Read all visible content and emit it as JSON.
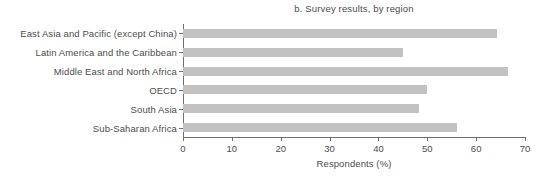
{
  "chart_data": {
    "type": "bar",
    "orientation": "horizontal",
    "title": "b. Survey results, by region",
    "xlabel": "Respondents (%)",
    "ylabel": "",
    "xlim": [
      0,
      70
    ],
    "xticks": [
      0,
      10,
      20,
      30,
      40,
      50,
      60,
      70
    ],
    "xtick_labels": [
      "0",
      "10",
      "20",
      "30",
      "40",
      "50",
      "60",
      "70"
    ],
    "grid": false,
    "legend": false,
    "bar_color": "#c2c2c2",
    "axis_color": "#6f6f6f",
    "text_color": "#4d4d4d",
    "categories": [
      "East Asia and Pacific (except China)",
      "Latin America and the Caribbean",
      "Middle East and North Africa",
      "OECD",
      "South Asia",
      "Sub-Saharan Africa"
    ],
    "values": [
      64.3,
      45.0,
      66.5,
      50.0,
      48.3,
      56.0
    ]
  }
}
